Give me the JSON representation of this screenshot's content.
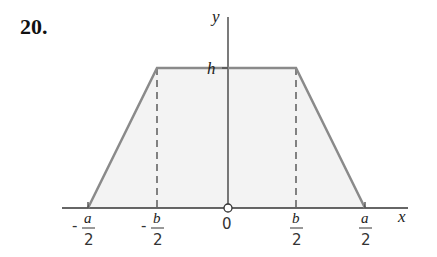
{
  "problem_number": "20.",
  "axes": {
    "x_label": "x",
    "y_label": "y"
  },
  "labels": {
    "height": "h",
    "origin": "0",
    "neg_a_half": {
      "sign": "-",
      "num": "a",
      "den": "2"
    },
    "neg_b_half": {
      "sign": "-",
      "num": "b",
      "den": "2"
    },
    "pos_b_half": {
      "num": "b",
      "den": "2"
    },
    "pos_a_half": {
      "num": "a",
      "den": "2"
    }
  },
  "colors": {
    "outline": "#8a8a8a",
    "fill": "#f4f4f4",
    "axis": "#333333"
  },
  "shape": {
    "type": "trapezoid",
    "vertices": [
      [
        "-a/2",
        0
      ],
      [
        "-b/2",
        "h"
      ],
      [
        "b/2",
        "h"
      ],
      [
        "a/2",
        0
      ]
    ]
  }
}
